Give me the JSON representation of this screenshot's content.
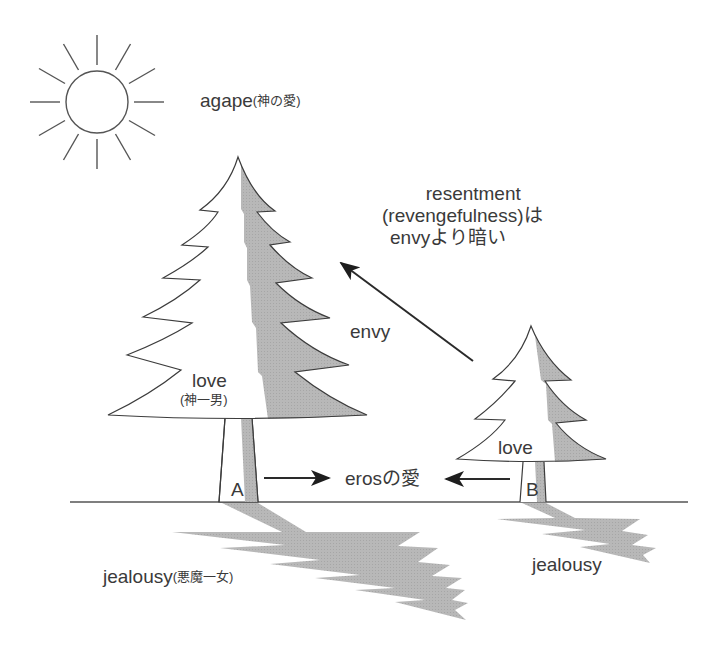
{
  "diagram": {
    "top_cutoff_text": "",
    "colors": {
      "line": "#3c3c3c",
      "shade": "#b4b4b4",
      "text": "#3a3a3a",
      "background": "#ffffff"
    },
    "sun": {
      "label": "agape",
      "label_note": "(神の愛)"
    },
    "tree_a": {
      "label": "love",
      "label_note": "(神一男)",
      "trunk_label": "A",
      "shadow_label": "jealousy",
      "shadow_note": "(悪魔一女)"
    },
    "tree_b": {
      "label": "love",
      "trunk_label": "B",
      "shadow_label": "jealousy"
    },
    "arrows": {
      "envy_label": "envy",
      "eros_label": "erosの愛"
    },
    "resentment_note": {
      "line1": "resentment",
      "line2": "(revengefulness)は",
      "line3": "envyより暗い"
    }
  }
}
